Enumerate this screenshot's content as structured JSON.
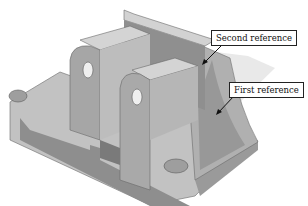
{
  "figure": {
    "colors": {
      "background": "#ffffff",
      "light_face": "#c9c9c9",
      "mid_face": "#a8a8a8",
      "dark_face": "#8a8a8a",
      "edge": "#5a5a5a",
      "plane": "#e4e4e4"
    }
  },
  "callouts": [
    {
      "label": "Second reference"
    },
    {
      "label": "First reference"
    }
  ]
}
